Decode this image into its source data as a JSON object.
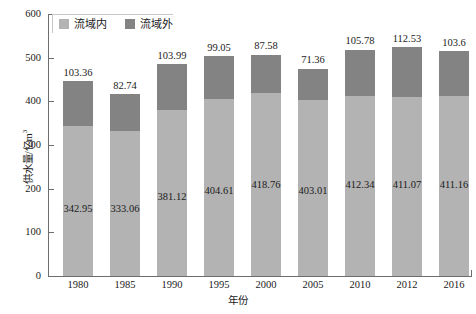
{
  "chart_data": {
    "type": "bar",
    "subtype": "stacked-vertical",
    "title": "",
    "xlabel": "年份",
    "ylabel": "供水量/亿m³",
    "ylim": [
      0,
      600
    ],
    "ytick_step": 100,
    "yticks": [
      "600",
      "500",
      "400",
      "300",
      "200",
      "100",
      "0"
    ],
    "grid": false,
    "legend_position": "top-left",
    "categories": [
      "1980",
      "1985",
      "1990",
      "1995",
      "2000",
      "2005",
      "2010",
      "2012",
      "2016"
    ],
    "series": [
      {
        "name": "流域内",
        "color": "#b3b3b3",
        "values": [
          342.95,
          333.06,
          381.12,
          404.61,
          418.76,
          403.01,
          412.34,
          411.07,
          411.16
        ]
      },
      {
        "name": "流域外",
        "color": "#838383",
        "values": [
          103.36,
          82.74,
          103.99,
          99.05,
          87.58,
          71.36,
          105.78,
          112.53,
          103.6
        ]
      }
    ],
    "inner_labels": [
      "342.95",
      "333.06",
      "381.12",
      "404.61",
      "418.76",
      "403.01",
      "412.34",
      "411.07",
      "411.16"
    ],
    "top_labels": [
      "103.36",
      "82.74",
      "103.99",
      "99.05",
      "87.58",
      "71.36",
      "105.78",
      "112.53",
      "103.6"
    ]
  },
  "legend": {
    "items": [
      {
        "label": "流域内",
        "color": "#b3b3b3"
      },
      {
        "label": "流域外",
        "color": "#838383"
      }
    ]
  },
  "axes": {
    "y_title": "供水量/亿m",
    "y_title_sup": "3",
    "x_title": "年份"
  }
}
